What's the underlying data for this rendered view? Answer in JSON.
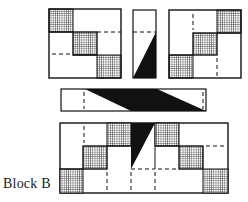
{
  "caption": "Block B",
  "colors": {
    "ink": "#111111",
    "background": "#ffffff",
    "hatch": "#333333"
  },
  "pieces": [
    {
      "name": "left-square-unit",
      "pattern": "diagonal of 3 grid-hatched squares, top-left to bottom-right, with dashed seams"
    },
    {
      "name": "narrow-strip",
      "pattern": "black right triangle with dashed line above"
    },
    {
      "name": "right-square-unit",
      "pattern": "diagonal of 3 grid-hatched squares, top-right to bottom-left, with dashed seams"
    },
    {
      "name": "horizontal-bar",
      "pattern": "black parallelogram band across bar, dashed ends"
    },
    {
      "name": "assembled-block",
      "pattern": "combined left unit, black triangle strip, right unit"
    }
  ]
}
